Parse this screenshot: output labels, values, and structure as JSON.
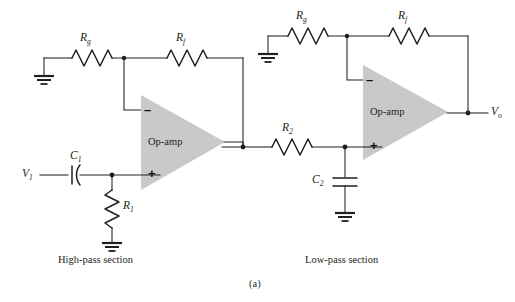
{
  "figure": {
    "label": "(a)"
  },
  "sections": [
    {
      "name": "high-pass",
      "caption": "High-pass section"
    },
    {
      "name": "low-pass",
      "caption": "Low-pass section"
    }
  ],
  "high_pass": {
    "opamp_label": "Op-amp",
    "minus_sign": "–",
    "plus_sign": "+",
    "input_label": {
      "base": "V",
      "sub": "1"
    },
    "components": [
      {
        "id": "Rg",
        "type": "resistor",
        "base": "R",
        "sub": "g"
      },
      {
        "id": "Rf",
        "type": "resistor",
        "base": "R",
        "sub": "f"
      },
      {
        "id": "C1",
        "type": "capacitor",
        "base": "C",
        "sub": "1"
      },
      {
        "id": "R1",
        "type": "resistor",
        "base": "R",
        "sub": "1"
      }
    ]
  },
  "low_pass": {
    "opamp_label": "Op-amp",
    "minus_sign": "–",
    "plus_sign": "+",
    "output_label": {
      "base": "V",
      "sub": "o"
    },
    "components": [
      {
        "id": "Rg2",
        "type": "resistor",
        "base": "R",
        "sub": "g"
      },
      {
        "id": "Rf2",
        "type": "resistor",
        "base": "R",
        "sub": "f"
      },
      {
        "id": "R2",
        "type": "resistor",
        "base": "R",
        "sub": "2"
      },
      {
        "id": "C2",
        "type": "capacitor",
        "base": "C",
        "sub": "2"
      }
    ]
  },
  "colors": {
    "line": "#231f20",
    "opamp_fill": "#c9c9c9",
    "background": "#ffffff"
  }
}
